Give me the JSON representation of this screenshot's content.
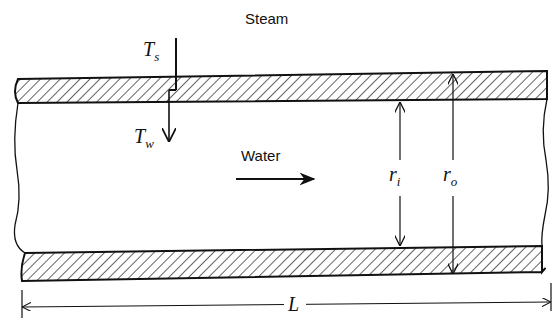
{
  "diagram": {
    "title_label": "Steam",
    "flow_label": "Water",
    "ts_label": {
      "main": "T",
      "sub": "s"
    },
    "tw_label": {
      "main": "T",
      "sub": "w"
    },
    "ri_label": {
      "main": "r",
      "sub": "i"
    },
    "ro_label": {
      "main": "r",
      "sub": "o"
    },
    "length_label": "L",
    "colors": {
      "line": "#111111",
      "background": "#ffffff"
    }
  }
}
